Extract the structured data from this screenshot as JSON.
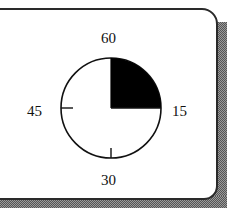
{
  "timer_dialog": {
    "labels": {
      "top": "60",
      "right": "15",
      "bottom": "30",
      "left": "45"
    },
    "dial": {
      "max_minutes": 60,
      "filled_minutes": 15,
      "fill_color": "#000000",
      "face_color": "#ffffff",
      "stroke_color": "#111111",
      "tick_marks": [
        "30",
        "45"
      ],
      "icon": "timer-dial-icon"
    }
  }
}
